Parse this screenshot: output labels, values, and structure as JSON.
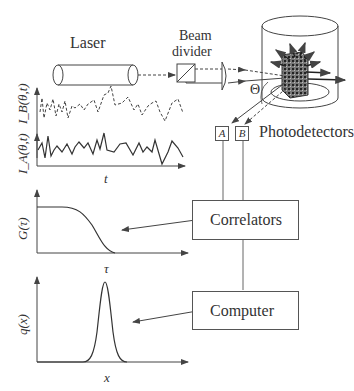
{
  "labels": {
    "laser": "Laser",
    "beam_divider_line1": "Beam",
    "beam_divider_line2": "divider",
    "theta": "Θ",
    "photodetectors": "Photodetectors",
    "detector_a": "A",
    "detector_b": "B",
    "correlators": "Correlators",
    "computer": "Computer"
  },
  "plots": {
    "intensity": {
      "ylabel_a": "I_A(θ,t)",
      "ylabel_b": "I_B(θ,t)",
      "xlabel": "t",
      "series": [
        {
          "name": "I_B(θ,t)",
          "style": "dashed"
        },
        {
          "name": "I_A(θ,t)",
          "style": "solid"
        }
      ]
    },
    "correlation": {
      "ylabel": "G(τ)",
      "xlabel": "τ",
      "shape": "decaying sigmoid"
    },
    "distribution": {
      "ylabel": "q(x)",
      "xlabel": "x",
      "shape": "gaussian peak"
    }
  },
  "colors": {
    "line": "#444444",
    "background": "#ffffff"
  }
}
